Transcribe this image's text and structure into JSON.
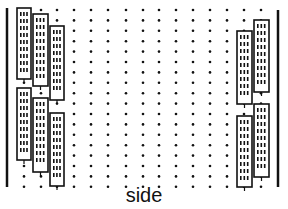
{
  "caption": "side",
  "colors": {
    "ink": "#111111",
    "background": "#ffffff"
  },
  "diagram": {
    "left_wall": {
      "label": "",
      "icon": "wall-line"
    },
    "right_wall": {
      "label": "",
      "icon": "wall-line"
    },
    "dot_grid": {
      "columns": 12,
      "rows": 17
    },
    "left_buildings": {
      "count": 6,
      "columns": 3,
      "window_cols": 3
    },
    "right_buildings": {
      "count": 4,
      "columns": 2,
      "window_cols": 3
    }
  }
}
